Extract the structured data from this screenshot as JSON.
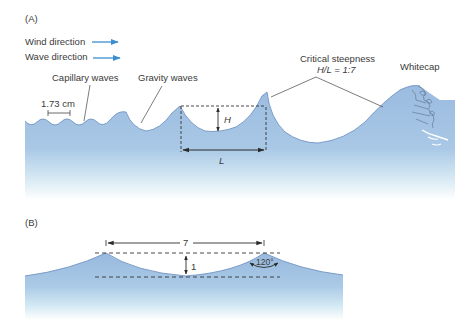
{
  "panel_a": {
    "label": "(A)",
    "legend": [
      {
        "text": "Wind direction",
        "icon": "arrow-right-icon"
      },
      {
        "text": "Wave direction",
        "icon": "arrow-right-icon"
      }
    ],
    "capillary_label": "Capillary waves",
    "capillary_length": "1.73 cm",
    "gravity_label": "Gravity waves",
    "critical_label_line1": "Critical steepness",
    "critical_label_line2": "H/L = 1:7",
    "whitecap_label": "Whitecap",
    "height_label": "H",
    "length_label": "L"
  },
  "panel_b": {
    "label": "(B)",
    "length_value": "7",
    "height_value": "1",
    "angle_label": "120°"
  },
  "colors": {
    "water_top": "#8fb3dc",
    "water_bottom": "#ffffff",
    "arrow_blue": "#3b8fd0",
    "line": "#333333"
  }
}
